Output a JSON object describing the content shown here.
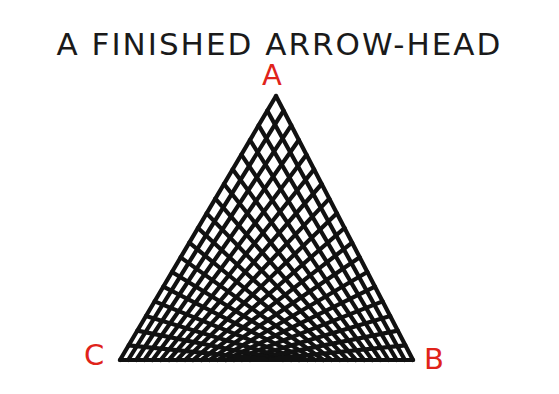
{
  "title": "A FINISHED ARROW-HEAD",
  "labels": {
    "a": "A",
    "b": "B",
    "c": "C"
  },
  "colors": {
    "label": "#e0231a",
    "lines": "#111111"
  },
  "triangle": {
    "apex": [
      276,
      96
    ],
    "left_base": [
      120,
      360
    ],
    "right_base": [
      413,
      360
    ],
    "line_count_per_family": 19
  }
}
